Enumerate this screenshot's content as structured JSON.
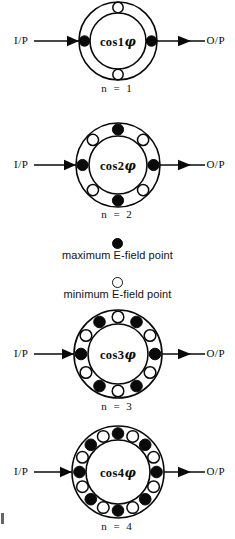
{
  "figure": {
    "type": "resonator-mode-diagrams",
    "width": 235,
    "height": 539,
    "background": "#ffffff",
    "ink_color": "#0a0a0a"
  },
  "labels": {
    "input": "I/P",
    "output": "O/P"
  },
  "legend": {
    "entries": [
      {
        "marker": "filled-dot",
        "text": "maximum E-field point"
      },
      {
        "marker": "open-circle",
        "text": "minimum E-field point"
      }
    ]
  },
  "diagrams": [
    {
      "id": "mode-n1",
      "ring_label_prefix": "cos",
      "ring_label_order": "1",
      "ring_label_phi": "φ",
      "caption": "n  =  1",
      "mode_number": 1,
      "point_count": 4,
      "input": "I/P",
      "output": "O/P",
      "center_y": 41,
      "outer_radius": 39,
      "inner_radius": 28,
      "dot_radius": 5.2,
      "dot_orbit": 33.5,
      "points": [
        {
          "angle": 0,
          "type": "maximum"
        },
        {
          "angle": 90,
          "type": "minimum"
        },
        {
          "angle": 180,
          "type": "maximum"
        },
        {
          "angle": 270,
          "type": "minimum"
        }
      ]
    },
    {
      "id": "mode-n2",
      "ring_label_prefix": "cos",
      "ring_label_order": "2",
      "ring_label_phi": "φ",
      "caption": "n  =  2",
      "mode_number": 2,
      "point_count": 8,
      "input": "I/P",
      "output": "O/P",
      "center_y": 165,
      "outer_radius": 42,
      "inner_radius": 29,
      "dot_radius": 5.6,
      "dot_orbit": 35.5,
      "points": [
        {
          "angle": 0,
          "type": "maximum"
        },
        {
          "angle": 45,
          "type": "minimum"
        },
        {
          "angle": 90,
          "type": "maximum"
        },
        {
          "angle": 135,
          "type": "minimum"
        },
        {
          "angle": 180,
          "type": "maximum"
        },
        {
          "angle": 225,
          "type": "minimum"
        },
        {
          "angle": 270,
          "type": "maximum"
        },
        {
          "angle": 315,
          "type": "minimum"
        }
      ]
    },
    {
      "id": "mode-n3",
      "ring_label_prefix": "cos",
      "ring_label_order": "3",
      "ring_label_phi": "φ",
      "caption": "n  =  3",
      "mode_number": 3,
      "point_count": 12,
      "input": "I/P",
      "output": "O/P",
      "center_y": 354,
      "outer_radius": 44,
      "inner_radius": 30,
      "dot_radius": 5.8,
      "dot_orbit": 37,
      "points": [
        {
          "angle": 0,
          "type": "maximum"
        },
        {
          "angle": 30,
          "type": "minimum"
        },
        {
          "angle": 60,
          "type": "maximum"
        },
        {
          "angle": 90,
          "type": "minimum"
        },
        {
          "angle": 120,
          "type": "maximum"
        },
        {
          "angle": 150,
          "type": "minimum"
        },
        {
          "angle": 180,
          "type": "maximum"
        },
        {
          "angle": 210,
          "type": "minimum"
        },
        {
          "angle": 240,
          "type": "maximum"
        },
        {
          "angle": 270,
          "type": "minimum"
        },
        {
          "angle": 300,
          "type": "maximum"
        },
        {
          "angle": 330,
          "type": "minimum"
        }
      ]
    },
    {
      "id": "mode-n4",
      "ring_label_prefix": "cos",
      "ring_label_order": "4",
      "ring_label_phi": "φ",
      "caption": "n  =  4",
      "mode_number": 4,
      "point_count": 16,
      "input": "I/P",
      "output": "O/P",
      "center_y": 472,
      "outer_radius": 46,
      "inner_radius": 32,
      "dot_radius": 5.8,
      "dot_orbit": 38.5,
      "points": [
        {
          "angle": 0,
          "type": "maximum"
        },
        {
          "angle": 22.5,
          "type": "minimum"
        },
        {
          "angle": 45,
          "type": "maximum"
        },
        {
          "angle": 67.5,
          "type": "minimum"
        },
        {
          "angle": 90,
          "type": "maximum"
        },
        {
          "angle": 112.5,
          "type": "minimum"
        },
        {
          "angle": 135,
          "type": "maximum"
        },
        {
          "angle": 157.5,
          "type": "minimum"
        },
        {
          "angle": 180,
          "type": "maximum"
        },
        {
          "angle": 202.5,
          "type": "minimum"
        },
        {
          "angle": 225,
          "type": "maximum"
        },
        {
          "angle": 247.5,
          "type": "minimum"
        },
        {
          "angle": 270,
          "type": "maximum"
        },
        {
          "angle": 292.5,
          "type": "minimum"
        },
        {
          "angle": 315,
          "type": "maximum"
        },
        {
          "angle": 337.5,
          "type": "minimum"
        }
      ]
    }
  ]
}
